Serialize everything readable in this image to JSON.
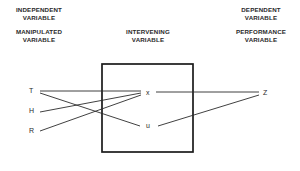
{
  "diagram": {
    "headers": [
      {
        "id": "independent",
        "line1": "INDEPENDENT",
        "line2": "VARIABLE"
      },
      {
        "id": "manipulated",
        "line1": "MANIPULATED",
        "line2": "VARIABLE"
      },
      {
        "id": "intervening",
        "line1": "INTERVENING",
        "line2": "VARIABLE"
      },
      {
        "id": "dependent",
        "line1": "DEPENDENT",
        "line2": "VARIABLE"
      },
      {
        "id": "performance",
        "line1": "PERFORMANCE",
        "line2": "VARIABLE"
      }
    ],
    "nodes": [
      {
        "id": "T",
        "label": "T",
        "side": "left",
        "x": 38,
        "y": 91
      },
      {
        "id": "H",
        "label": "H",
        "side": "left",
        "x": 38,
        "y": 111
      },
      {
        "id": "R",
        "label": "R",
        "side": "left",
        "x": 38,
        "y": 131
      },
      {
        "id": "x",
        "label": "x",
        "side": "center",
        "x": 148,
        "y": 93
      },
      {
        "id": "u",
        "label": "u",
        "side": "center",
        "x": 148,
        "y": 126
      },
      {
        "id": "Z",
        "label": "Z",
        "side": "right",
        "x": 265,
        "y": 93
      }
    ],
    "box": {
      "x": 102,
      "y": 64,
      "width": 91,
      "height": 88
    },
    "edges": [
      {
        "from": "T",
        "to": "x",
        "x1": 40,
        "y1": 91,
        "x2": 141,
        "y2": 91
      },
      {
        "from": "T",
        "to": "u",
        "x1": 40,
        "y1": 93,
        "x2": 140,
        "y2": 126
      },
      {
        "from": "H",
        "to": "x",
        "x1": 40,
        "y1": 112,
        "x2": 141,
        "y2": 93
      },
      {
        "from": "R",
        "to": "x",
        "x1": 40,
        "y1": 131,
        "x2": 141,
        "y2": 95
      },
      {
        "from": "x",
        "to": "Z",
        "x1": 156,
        "y1": 92,
        "x2": 259,
        "y2": 92
      },
      {
        "from": "u",
        "to": "Z",
        "x1": 158,
        "y1": 126,
        "x2": 259,
        "y2": 95
      }
    ],
    "colors": {
      "line": "#2b2b2b",
      "box_border": "#1a1a1a",
      "text": "#2a2a2a",
      "background": "#ffffff"
    }
  }
}
